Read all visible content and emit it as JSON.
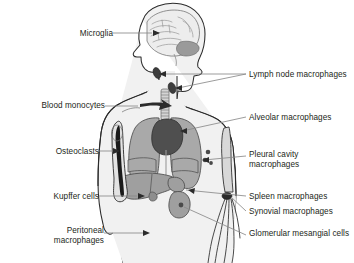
{
  "figure": {
    "background_color": "#ffffff",
    "text_color": "#231f20",
    "leader_line_color": "#8a8a8a",
    "outline_color": "#2b2b2b",
    "palette": {
      "body_fill": "#f1f1f1",
      "organ_light": "#d6d6d6",
      "organ_mid": "#a9a9a9",
      "organ_dark": "#5a5a5a",
      "marrow_dark": "#1a1a1a",
      "bone_fill": "#e3e3e3",
      "brain_fill": "#ededed",
      "cerebellum_fill": "#9a9a9a"
    }
  },
  "labels": {
    "left": [
      {
        "id": "microglia",
        "text": "Microglia",
        "lines": [
          "Microglia"
        ],
        "x": 74,
        "y": 29,
        "align": "right",
        "target": "brain"
      },
      {
        "id": "blood-monocytes",
        "text": "Blood monocytes",
        "lines": [
          "Blood",
          "monocytes"
        ],
        "x": 83,
        "y": 101,
        "align": "right",
        "target": "shoulder-vessel"
      },
      {
        "id": "osteoclasts",
        "text": "Osteoclasts",
        "lines": [
          "Osteoclasts"
        ],
        "x": 76,
        "y": 147,
        "align": "right",
        "target": "humerus-bone"
      },
      {
        "id": "kupffer-cells",
        "text": "Kupffer cells",
        "lines": [
          "Kupffer cells"
        ],
        "x": 76,
        "y": 192,
        "align": "right",
        "target": "liver"
      },
      {
        "id": "peritoneal-macrophages",
        "text": "Peritoneal macrophages",
        "lines": [
          "Peritoneal",
          "macrophages"
        ],
        "x": 79,
        "y": 226,
        "align": "right",
        "target": "peritoneum"
      }
    ],
    "right": [
      {
        "id": "lymph-node-macrophages",
        "text": "Lymph node macrophages",
        "lines": [
          "Lymph node",
          "macrophages"
        ],
        "x": 249,
        "y": 70,
        "align": "left",
        "target": "lymph-nodes"
      },
      {
        "id": "alveolar-macrophages",
        "text": "Alveolar macrophages",
        "lines": [
          "Alveolar macrophages"
        ],
        "x": 249,
        "y": 113,
        "align": "left",
        "target": "lung"
      },
      {
        "id": "pleural-cavity-macrophages",
        "text": "Pleural cavity macrophages",
        "lines": [
          "Pleural cavity",
          "macrophages"
        ],
        "x": 249,
        "y": 150,
        "align": "left",
        "target": "pleural-cavity"
      },
      {
        "id": "spleen-macrophages",
        "text": "Spleen macrophages",
        "lines": [
          "Spleen macrophages"
        ],
        "x": 249,
        "y": 194,
        "align": "left",
        "target": "spleen"
      },
      {
        "id": "synovial-macrophages",
        "text": "Synovial macrophages",
        "lines": [
          "Synovial macrophages"
        ],
        "x": 249,
        "y": 209,
        "align": "left",
        "target": "elbow-joint"
      },
      {
        "id": "glomerular-mesangial-cells",
        "text": "Glomerular mesangial cells",
        "lines": [
          "Glomerular mesangial",
          "cells"
        ],
        "x": 249,
        "y": 231,
        "align": "left",
        "target": "kidney"
      }
    ]
  },
  "anatomy": {
    "organs": [
      {
        "id": "brain",
        "name": "brain",
        "fill": "#ededed"
      },
      {
        "id": "cerebellum",
        "name": "cerebellum",
        "fill": "#9a9a9a"
      },
      {
        "id": "lymph-nodes",
        "name": "lymph-nodes",
        "fill": "#3d3d3d",
        "count": 2
      },
      {
        "id": "trachea",
        "name": "trachea",
        "fill": "#cfcfcf"
      },
      {
        "id": "lung-left",
        "name": "lung",
        "fill": "#a9a9a9"
      },
      {
        "id": "lung-right",
        "name": "lung",
        "fill": "#a9a9a9"
      },
      {
        "id": "heart",
        "name": "heart",
        "fill": "#4f4f4f"
      },
      {
        "id": "liver",
        "name": "liver",
        "fill": "#9f9f9f"
      },
      {
        "id": "spleen",
        "name": "spleen",
        "fill": "#9f9f9f"
      },
      {
        "id": "stomach",
        "name": "stomach",
        "fill": "#9f9f9f"
      },
      {
        "id": "kidney",
        "name": "kidney",
        "fill": "#9f9f9f"
      },
      {
        "id": "humerus",
        "name": "humerus-bone",
        "fill": "#e3e3e3",
        "marrow": "#1a1a1a"
      },
      {
        "id": "pleural-dots",
        "name": "pleural-macrophage-dots",
        "fill": "#4a4a4a",
        "count": 3
      },
      {
        "id": "elbow-joint",
        "name": "elbow-joint",
        "fill": "#2b2b2b"
      }
    ]
  }
}
